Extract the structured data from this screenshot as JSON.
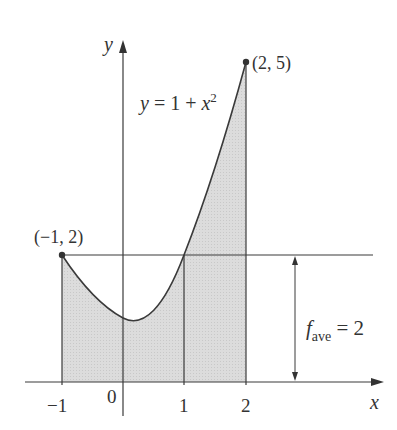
{
  "diagram": {
    "function_label": "y = 1 + x²",
    "function_label_parts": {
      "lhs": "y",
      "eq": " = 1 + ",
      "var": "x",
      "exp": "2"
    },
    "axis": {
      "x_label": "x",
      "y_label": "y"
    },
    "x_ticks": [
      "−1",
      "0",
      "1",
      "2"
    ],
    "points": [
      {
        "label": "(−1, 2)",
        "x": -1,
        "y": 2
      },
      {
        "label": "(2, 5)",
        "x": 2,
        "y": 5
      }
    ],
    "average": {
      "label_f": "f",
      "label_sub": "ave",
      "label_rest": " = 2",
      "value": 2
    },
    "interval": [
      -1,
      2
    ],
    "colors": {
      "line": "#3a3a3a",
      "shade": "#d9d9d9",
      "text": "#333333"
    }
  }
}
